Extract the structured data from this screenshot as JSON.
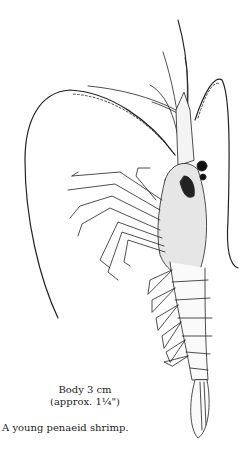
{
  "figure": {
    "line_color": "#222222"
  },
  "caption": {
    "size_line1": "Body 3 cm",
    "size_line2": "(approx. 1¼\")",
    "title": "A young penaeid shrimp."
  }
}
